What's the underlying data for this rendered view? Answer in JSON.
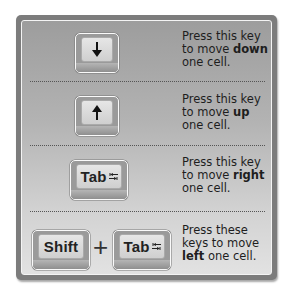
{
  "rows": [
    {
      "keys": [
        {
          "label": "",
          "icon": "arrow-down-icon"
        }
      ],
      "desc_prefix": "Press this key to move ",
      "desc_bold": "down",
      "desc_suffix": " one cell."
    },
    {
      "keys": [
        {
          "label": "",
          "icon": "arrow-up-icon"
        }
      ],
      "desc_prefix": "Press this key to move ",
      "desc_bold": "up",
      "desc_suffix": " one cell."
    },
    {
      "keys": [
        {
          "label": "Tab",
          "icon": "tab-arrows-icon"
        }
      ],
      "desc_prefix": "Press this key to move ",
      "desc_bold": "right",
      "desc_suffix": " one cell."
    },
    {
      "keys": [
        {
          "label": "Shift"
        },
        {
          "label": "Tab",
          "icon": "tab-arrows-icon"
        }
      ],
      "combiner": "+",
      "desc_prefix": "Press these keys to move ",
      "desc_bold": "left",
      "desc_suffix": " one cell."
    }
  ],
  "colors": {
    "panel_border": "#7c7c7c",
    "panel_gradient_top": "#9d9d9d",
    "panel_gradient_bottom": "#e2e2e2",
    "key_face": "#dcdcdc",
    "text": "#1e1e1e"
  }
}
